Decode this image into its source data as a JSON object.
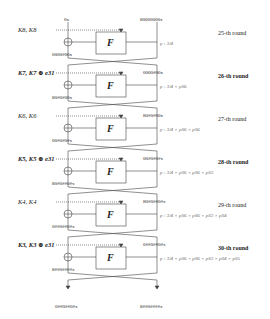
{
  "diagram": {
    "top_inputs": {
      "left": "0x",
      "right": "80000000x"
    },
    "function_label": "F",
    "rounds": [
      {
        "label": "25-th round",
        "bold": false,
        "keys": "K8, K8",
        "left_out": "0000#00x",
        "right_in": "80000000x",
        "prob": "p : 3/4"
      },
      {
        "label": "26-th round",
        "bold": true,
        "keys": "K7, K7 ⊕ e31",
        "left_out": "80#0#00x",
        "right_in": "0000#00x",
        "prob": "p : 3/4 × pS6"
      },
      {
        "label": "27-th round",
        "bold": false,
        "keys": "K6, K6",
        "left_out": "00#0#0#x",
        "right_in": "80#0#00x",
        "prob": "p : 3/4 × pS6 × pS6"
      },
      {
        "label": "28-th round",
        "bold": true,
        "keys": "K5, K5 ⊕ e31",
        "left_out": "80#0##0#x",
        "right_in": "00#0#0#x",
        "prob": "p : 3/4 × pS6 × pS6 × pS3"
      },
      {
        "label": "29-th round",
        "bold": false,
        "keys": "K4, K4",
        "left_out": "0##0##0#x",
        "right_in": "80#0##0#x",
        "prob": "p : 3/4 × pS6 × pS6 × pS3 × pS4"
      },
      {
        "label": "30-th round",
        "bold": true,
        "keys": "K3, K3 ⊕ e31",
        "left_out": "8##0####x",
        "right_in": "0##0##0#x",
        "prob": "p : 3/4 × pS6 × pS6 × pS3 × pS4 × pS5"
      }
    ],
    "outputs": {
      "left": "0##0##0#x",
      "right": "8##0####x"
    }
  }
}
